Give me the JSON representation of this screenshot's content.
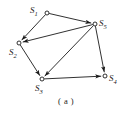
{
  "figure": {
    "caption": "( a )",
    "caption_pos": {
      "x": 58,
      "y": 96
    },
    "width": 127,
    "height": 115,
    "background": "#ffffff",
    "stroke_color": "#1a1a1a",
    "text_color": "#1a1a1a"
  },
  "chart_data": {
    "type": "diagram",
    "title": "( a )",
    "subtitle": "",
    "xlabel": "",
    "ylabel": "",
    "graph_kind": "directed-graph",
    "node_marker": "small-open-circle",
    "nodes": [
      {
        "id": "S1",
        "label": "S",
        "sub": "1",
        "x": 47,
        "y": 13,
        "label_x": 30,
        "label_y": 6
      },
      {
        "id": "S2",
        "label": "S",
        "sub": "2",
        "x": 19,
        "y": 43,
        "label_x": 9,
        "label_y": 48
      },
      {
        "id": "S3",
        "label": "S",
        "sub": "3",
        "x": 42,
        "y": 79,
        "label_x": 35,
        "label_y": 84
      },
      {
        "id": "S4",
        "label": "S",
        "sub": "4",
        "x": 105,
        "y": 76,
        "label_x": 109,
        "label_y": 74
      },
      {
        "id": "S5",
        "label": "S",
        "sub": "5",
        "x": 95,
        "y": 24,
        "label_x": 99,
        "label_y": 19
      }
    ],
    "edges": [
      {
        "from": "S1",
        "to": "S5",
        "directed": true
      },
      {
        "from": "S1",
        "to": "S2",
        "directed": true
      },
      {
        "from": "S5",
        "to": "S2",
        "directed": true
      },
      {
        "from": "S2",
        "to": "S3",
        "directed": true
      },
      {
        "from": "S5",
        "to": "S3",
        "directed": true
      },
      {
        "from": "S5",
        "to": "S4",
        "directed": true
      },
      {
        "from": "S3",
        "to": "S4",
        "directed": true
      }
    ]
  }
}
